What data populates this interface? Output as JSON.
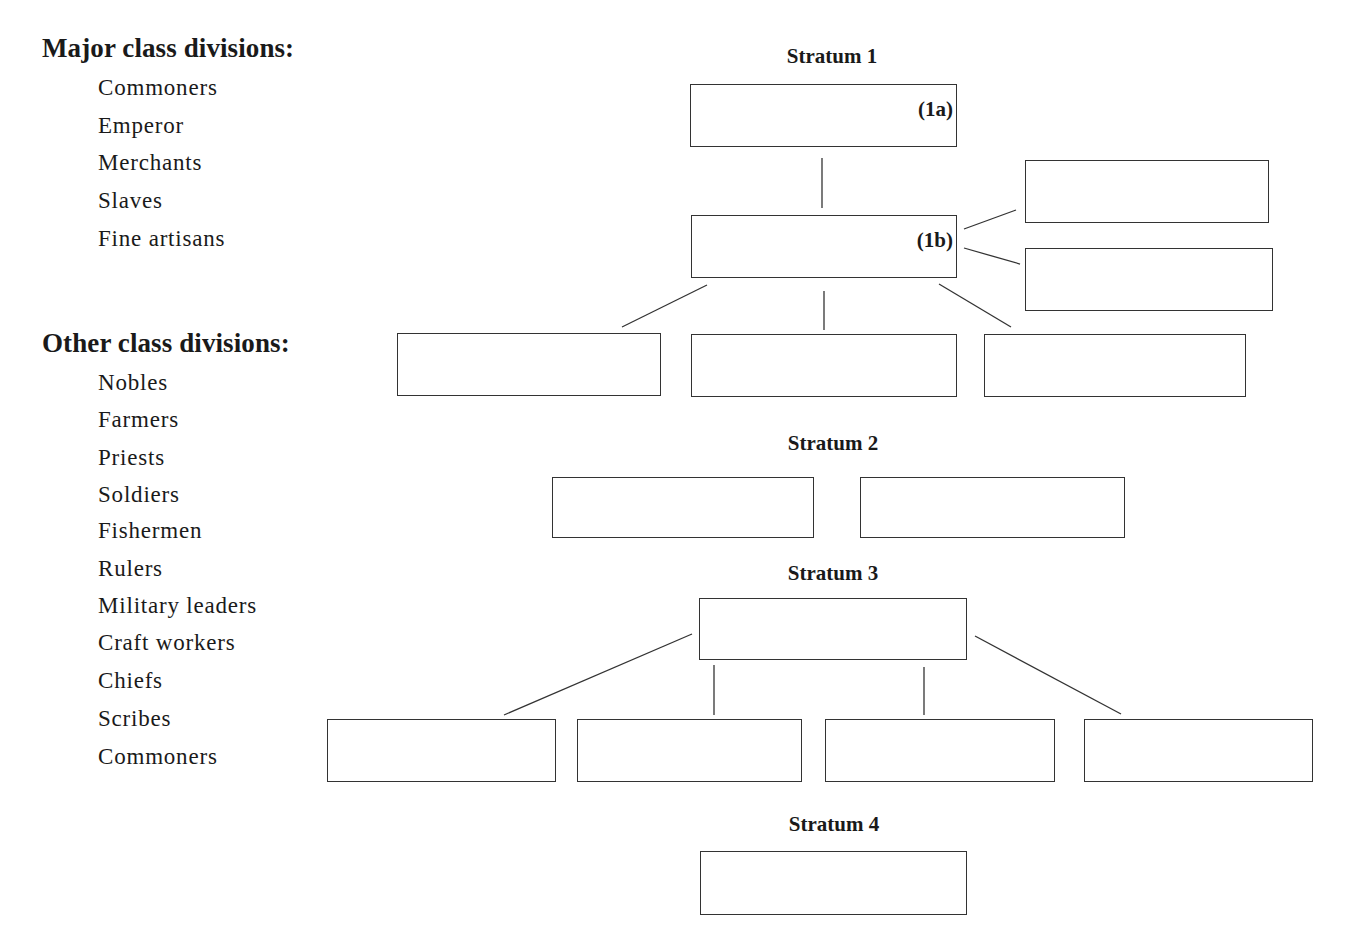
{
  "left_panel": {
    "major": {
      "heading": "Major class divisions:",
      "items": [
        "Commoners",
        "Emperor",
        "Merchants",
        "Slaves",
        "Fine artisans"
      ]
    },
    "other": {
      "heading": "Other class divisions:",
      "items": [
        "Nobles",
        "Farmers",
        "Priests",
        "Soldiers",
        "Fishermen",
        "Rulers",
        "Military leaders",
        "Craft workers",
        "Chiefs",
        "Scribes",
        "Commoners"
      ]
    }
  },
  "diagram": {
    "stratum1": {
      "label": "Stratum 1",
      "box_1a_tag": "(1a)",
      "box_1b_tag": "(1b)"
    },
    "stratum2": {
      "label": "Stratum 2"
    },
    "stratum3": {
      "label": "Stratum 3"
    },
    "stratum4": {
      "label": "Stratum 4"
    }
  }
}
